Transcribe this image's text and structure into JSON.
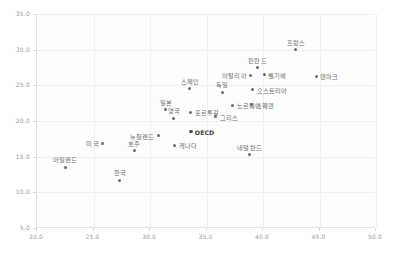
{
  "chart_data": {
    "type": "scatter",
    "title": "",
    "subtitle": "",
    "xlabel": "",
    "ylabel": "",
    "xlim": [
      20.0,
      50.0
    ],
    "ylim": [
      5.0,
      35.0
    ],
    "xticks": [
      "20.0",
      "25.0",
      "30.0",
      "35.0",
      "40.0",
      "45.0",
      "50.0"
    ],
    "yticks": [
      "5.0",
      "10.0",
      "15.0",
      "20.0",
      "25.0",
      "30.0",
      "35.0"
    ],
    "grid": true,
    "legend": "none",
    "marker_color": "#6b6b6b",
    "highlight_color": "#3d3d3d",
    "grid_color": "#f0f0f0",
    "axis_color": "#e3e3e3",
    "tick_text_color": "#9a9a9a",
    "label_text_color": "#6e6e6e",
    "points": [
      {
        "label": "아일랜드",
        "x": 22.6,
        "y": 13.5,
        "pos": "above"
      },
      {
        "label": "미국",
        "x": 25.9,
        "y": 16.9,
        "pos": "left"
      },
      {
        "label": "한국",
        "x": 27.4,
        "y": 11.7,
        "pos": "above"
      },
      {
        "label": "호주",
        "x": 28.7,
        "y": 15.8,
        "pos": "above"
      },
      {
        "label": "뉴질랜드",
        "x": 30.8,
        "y": 17.9,
        "pos": "left"
      },
      {
        "label": "일본",
        "x": 31.5,
        "y": 21.6,
        "pos": "above"
      },
      {
        "label": "영국",
        "x": 32.2,
        "y": 20.4,
        "pos": "above"
      },
      {
        "label": "캐나다",
        "x": 32.3,
        "y": 16.6,
        "pos": "right"
      },
      {
        "label": "스페인",
        "x": 33.6,
        "y": 24.5,
        "pos": "above"
      },
      {
        "label": "포르투갈",
        "x": 33.7,
        "y": 21.2,
        "pos": "right"
      },
      {
        "label": "OECD",
        "x": 33.7,
        "y": 18.5,
        "pos": "right"
      },
      {
        "label": "그리스",
        "x": 35.9,
        "y": 20.6,
        "pos": "right"
      },
      {
        "label": "독일",
        "x": 36.5,
        "y": 24.0,
        "pos": "above"
      },
      {
        "label": "노르웨이",
        "x": 37.4,
        "y": 22.2,
        "pos": "right"
      },
      {
        "label": "네덜란드",
        "x": 38.9,
        "y": 15.3,
        "pos": "above"
      },
      {
        "label": "이탈리아",
        "x": 39.0,
        "y": 26.4,
        "pos": "left"
      },
      {
        "label": "스웨덴",
        "x": 39.1,
        "y": 22.3,
        "pos": "right"
      },
      {
        "label": "오스트리아",
        "x": 39.2,
        "y": 24.4,
        "pos": "right"
      },
      {
        "label": "핀란드",
        "x": 39.6,
        "y": 27.5,
        "pos": "above"
      },
      {
        "label": "벨기에",
        "x": 40.2,
        "y": 26.5,
        "pos": "right"
      },
      {
        "label": "프랑스",
        "x": 43.0,
        "y": 30.0,
        "pos": "above"
      },
      {
        "label": "덴마크",
        "x": 44.8,
        "y": 26.3,
        "pos": "right"
      }
    ]
  }
}
